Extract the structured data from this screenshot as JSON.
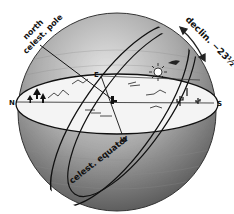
{
  "diagram": {
    "labels": {
      "north_pole": [
        "north",
        "celest. pole"
      ],
      "equator": "celest. equator",
      "declination": "declin. −23½°",
      "north": "N",
      "south": "S",
      "east": "E",
      "west": "W"
    },
    "colors": {
      "sphere_dark": "#6e6e6e",
      "sphere_light": "#d8d8d8",
      "horizon_fill": "#f4f4f4",
      "ink": "#111111"
    }
  }
}
